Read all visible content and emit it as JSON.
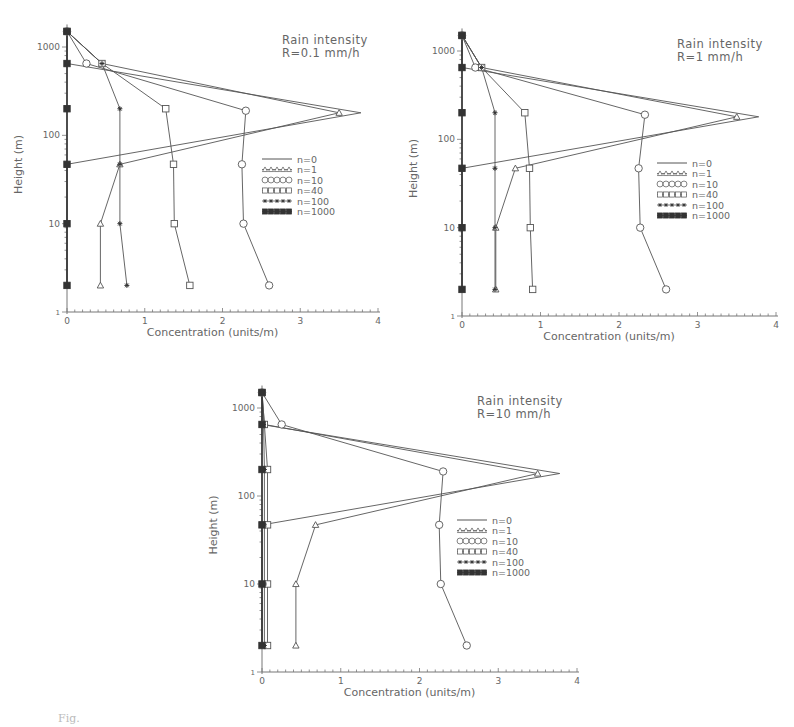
{
  "figure": {
    "caption": "Fig."
  },
  "legend": [
    {
      "label": "n=0",
      "marker": "none"
    },
    {
      "label": "n=1",
      "marker": "triangle"
    },
    {
      "label": "n=10",
      "marker": "circle"
    },
    {
      "label": "n=40",
      "marker": "square"
    },
    {
      "label": "n=100",
      "marker": "star"
    },
    {
      "label": "n=1000",
      "marker": "filled-square"
    }
  ],
  "chart_data": [
    {
      "type": "line",
      "title": "Rain intensity",
      "subtitle": "R=0.1 mm/h",
      "xlabel": "Concentration (units/m)",
      "ylabel": "Height (m)",
      "xlim": [
        0,
        4
      ],
      "ylim": [
        1,
        1600
      ],
      "yscale": "log",
      "xticks": [
        "0",
        "1",
        "2",
        "3",
        "4"
      ],
      "yticks": [
        "1",
        "10",
        "100",
        "1000"
      ],
      "heights": [
        1500,
        650,
        200,
        180,
        47,
        10,
        2
      ],
      "series": [
        {
          "name": "n=0",
          "points": [
            [
              0,
              1500
            ],
            [
              0,
              650
            ],
            [
              3.78,
              180
            ],
            [
              0,
              47
            ],
            [
              0,
              10
            ],
            [
              0,
              2
            ]
          ]
        },
        {
          "name": "n=1",
          "points": [
            [
              0,
              1500
            ],
            [
              0.45,
              650
            ],
            [
              3.5,
              180
            ],
            [
              0.68,
              47
            ],
            [
              0.43,
              10
            ],
            [
              0.43,
              2
            ]
          ]
        },
        {
          "name": "n=10",
          "points": [
            [
              0,
              1500
            ],
            [
              0.25,
              650
            ],
            [
              2.3,
              190
            ],
            [
              2.25,
              47
            ],
            [
              2.27,
              10
            ],
            [
              2.6,
              2
            ]
          ]
        },
        {
          "name": "n=40",
          "points": [
            [
              0,
              1500
            ],
            [
              0.45,
              650
            ],
            [
              1.27,
              200
            ],
            [
              1.37,
              47
            ],
            [
              1.38,
              10
            ],
            [
              1.58,
              2
            ]
          ]
        },
        {
          "name": "n=100",
          "points": [
            [
              0,
              1500
            ],
            [
              0.45,
              650
            ],
            [
              0.68,
              200
            ],
            [
              0.68,
              47
            ],
            [
              0.68,
              10
            ],
            [
              0.77,
              2
            ]
          ]
        },
        {
          "name": "n=1000",
          "points": [
            [
              0,
              1500
            ],
            [
              0,
              650
            ],
            [
              0,
              200
            ],
            [
              0,
              47
            ],
            [
              0,
              10
            ],
            [
              0,
              2
            ]
          ]
        }
      ]
    },
    {
      "type": "line",
      "title": "Rain intensity",
      "subtitle": "R=1 mm/h",
      "xlabel": "Concentration (units/m)",
      "ylabel": "Height (m)",
      "xlim": [
        0,
        4
      ],
      "ylim": [
        1,
        1600
      ],
      "yscale": "log",
      "xticks": [
        "0",
        "1",
        "2",
        "3",
        "4"
      ],
      "yticks": [
        "1",
        "10",
        "100",
        "1000"
      ],
      "series": [
        {
          "name": "n=0",
          "points": [
            [
              0,
              1500
            ],
            [
              0,
              650
            ],
            [
              3.78,
              180
            ],
            [
              0,
              47
            ],
            [
              0,
              10
            ],
            [
              0,
              2
            ]
          ]
        },
        {
          "name": "n=1",
          "points": [
            [
              0,
              1500
            ],
            [
              0.25,
              650
            ],
            [
              3.5,
              180
            ],
            [
              0.68,
              47
            ],
            [
              0.43,
              10
            ],
            [
              0.43,
              2
            ]
          ]
        },
        {
          "name": "n=10",
          "points": [
            [
              0,
              1500
            ],
            [
              0.17,
              650
            ],
            [
              2.33,
              190
            ],
            [
              2.25,
              47
            ],
            [
              2.27,
              10
            ],
            [
              2.6,
              2
            ]
          ]
        },
        {
          "name": "n=40",
          "points": [
            [
              0,
              1500
            ],
            [
              0.25,
              650
            ],
            [
              0.8,
              200
            ],
            [
              0.86,
              47
            ],
            [
              0.87,
              10
            ],
            [
              0.9,
              2
            ]
          ]
        },
        {
          "name": "n=100",
          "points": [
            [
              0,
              1500
            ],
            [
              0.25,
              650
            ],
            [
              0.42,
              200
            ],
            [
              0.42,
              47
            ],
            [
              0.42,
              10
            ],
            [
              0.42,
              2
            ]
          ]
        },
        {
          "name": "n=1000",
          "points": [
            [
              0,
              1500
            ],
            [
              0,
              650
            ],
            [
              0,
              200
            ],
            [
              0,
              47
            ],
            [
              0,
              10
            ],
            [
              0,
              2
            ]
          ]
        }
      ]
    },
    {
      "type": "line",
      "title": "Rain intensity",
      "subtitle": "R=10 mm/h",
      "xlabel": "Concentration (units/m)",
      "ylabel": "Height (m)",
      "xlim": [
        0,
        4
      ],
      "ylim": [
        1,
        1600
      ],
      "yscale": "log",
      "xticks": [
        "0",
        "1",
        "2",
        "3",
        "4"
      ],
      "yticks": [
        "1",
        "10",
        "100",
        "1000"
      ],
      "series": [
        {
          "name": "n=0",
          "points": [
            [
              0,
              1500
            ],
            [
              0,
              650
            ],
            [
              3.78,
              180
            ],
            [
              0,
              47
            ],
            [
              0,
              10
            ],
            [
              0,
              2
            ]
          ]
        },
        {
          "name": "n=1",
          "points": [
            [
              0,
              1500
            ],
            [
              0.03,
              650
            ],
            [
              3.5,
              180
            ],
            [
              0.68,
              47
            ],
            [
              0.43,
              10
            ],
            [
              0.43,
              2
            ]
          ]
        },
        {
          "name": "n=10",
          "points": [
            [
              0,
              1500
            ],
            [
              0.25,
              650
            ],
            [
              2.3,
              190
            ],
            [
              2.25,
              47
            ],
            [
              2.27,
              10
            ],
            [
              2.6,
              2
            ]
          ]
        },
        {
          "name": "n=40",
          "points": [
            [
              0,
              1500
            ],
            [
              0.03,
              650
            ],
            [
              0.07,
              200
            ],
            [
              0.07,
              47
            ],
            [
              0.07,
              10
            ],
            [
              0.07,
              2
            ]
          ]
        },
        {
          "name": "n=100",
          "points": [
            [
              0,
              1500
            ],
            [
              0.02,
              650
            ],
            [
              0.03,
              200
            ],
            [
              0.03,
              47
            ],
            [
              0.03,
              10
            ],
            [
              0.03,
              2
            ]
          ]
        },
        {
          "name": "n=1000",
          "points": [
            [
              0,
              1500
            ],
            [
              0,
              650
            ],
            [
              0,
              200
            ],
            [
              0,
              47
            ],
            [
              0,
              10
            ],
            [
              0,
              2
            ]
          ]
        }
      ]
    }
  ],
  "layout": {
    "panels": [
      {
        "x0": 67,
        "x4": 378,
        "y1": 312,
        "y1000": 47,
        "left": 0,
        "top": 0
      },
      {
        "x0": 462,
        "x4": 776,
        "y1": 316,
        "y1000": 51,
        "left": 0,
        "top": 0
      },
      {
        "x0": 262,
        "x4": 577,
        "y1": 672,
        "y1000": 408,
        "left": 0,
        "top": 0
      }
    ]
  }
}
